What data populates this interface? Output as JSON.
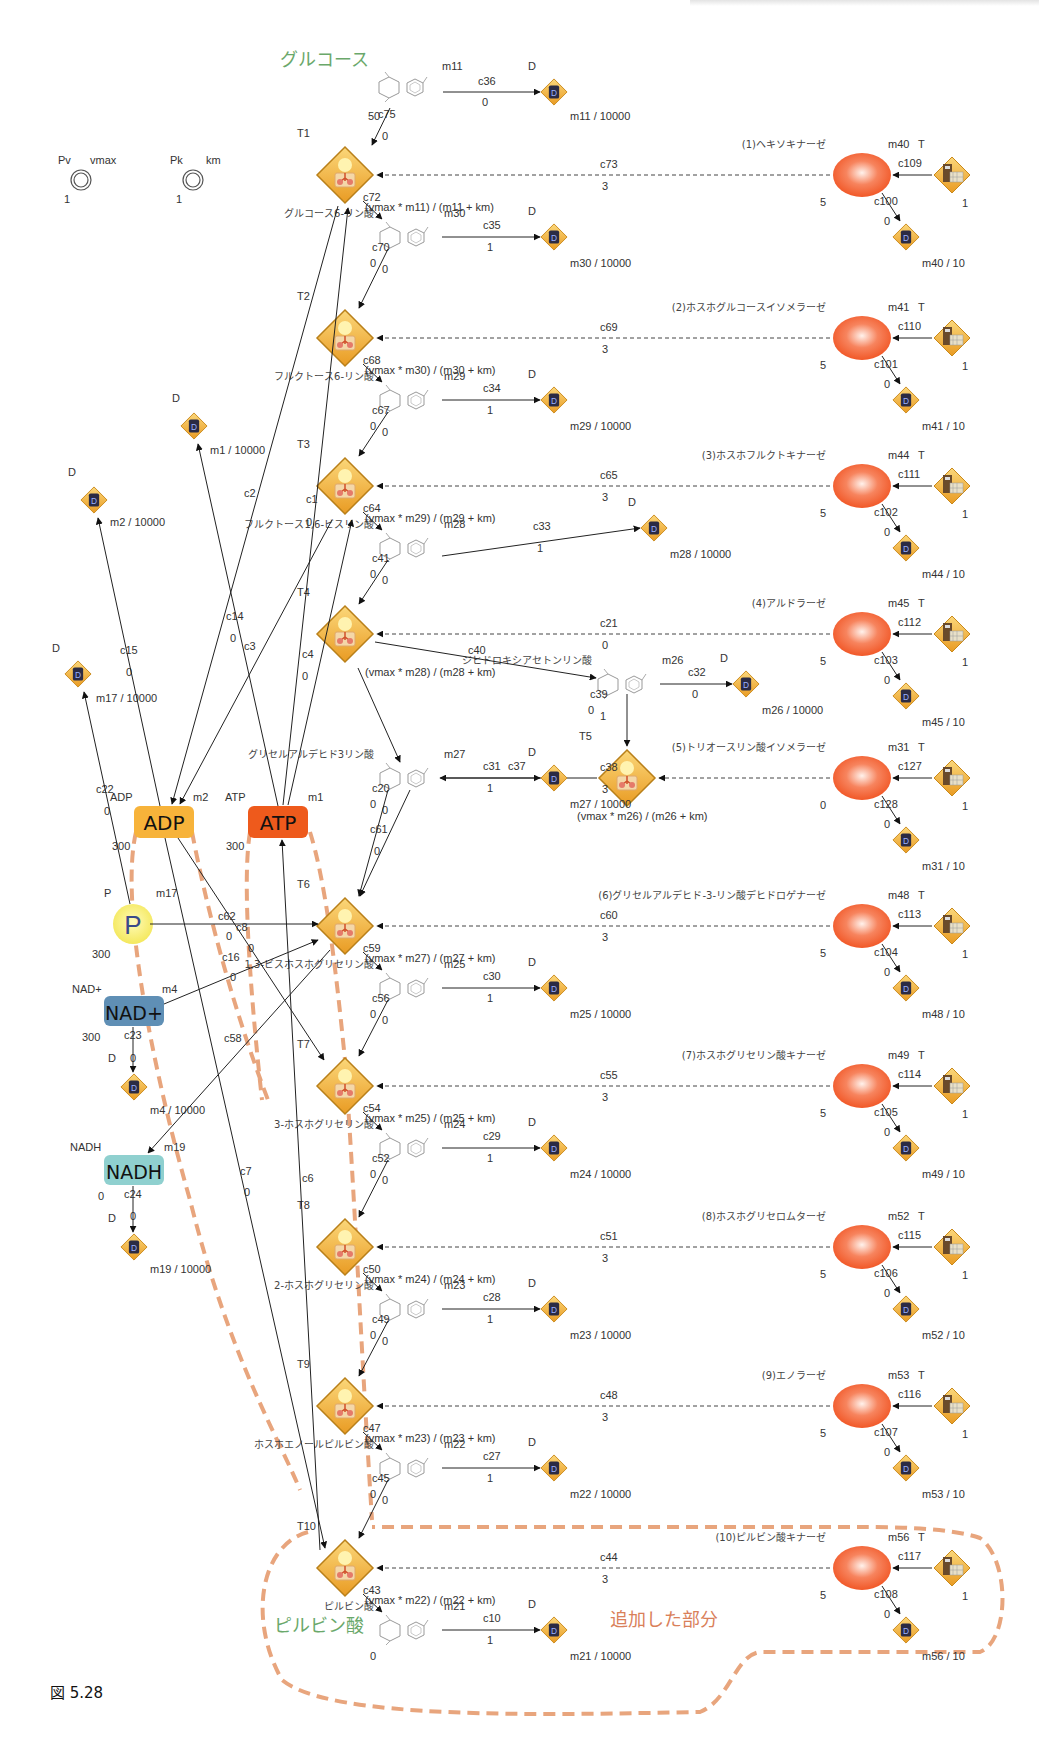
{
  "figure": {
    "caption": "図 5.28",
    "added_region_label": "追加した部分",
    "start_label": "グルコース",
    "end_label": "ピルビン酸",
    "colors": {
      "transition_fill": "#f3b33d",
      "enzyme_fill": "#f35b2b",
      "highlight": "#e8a57d",
      "green_label": "#6aa86a",
      "adp": "#f7b33a",
      "atp": "#ee5a1c",
      "p": "#f5ee7a",
      "nadp": "#5f8fb5",
      "nadh": "#8fd0cf"
    }
  },
  "parameters": [
    {
      "id": "Pv",
      "name": "vmax",
      "value": "1"
    },
    {
      "id": "Pk",
      "name": "km",
      "value": "1"
    }
  ],
  "glucose": {
    "id": "m11",
    "value": "50",
    "edge_in": "c75",
    "edge_in_weight": "0",
    "drain_edge": "c36",
    "drain_weight": "0",
    "drain_label": "D",
    "drain_expr": "m11 / 10000"
  },
  "steps": [
    {
      "transition": "T1",
      "rate": "(vmax * m11) / (m11 + km)",
      "out_edge": "c72",
      "product": "グルコース6-リン酸",
      "metabolite": "m30",
      "back_edge": "c70",
      "back_w1": "0",
      "back_w2": "0",
      "drain_edge": "c35",
      "drain_weight": "1",
      "drain_label": "D",
      "drain_expr": "m30 / 10000",
      "enzyme": {
        "name": "(1)ヘキソキナーゼ",
        "id": "m40",
        "type": "T",
        "edge": "c73",
        "edge_weight": "3",
        "initial": "5",
        "gen_edge": "c109",
        "gen_value": "1",
        "decay_edge": "c100",
        "decay_weight": "0",
        "decay_expr": "m40 / 10"
      }
    },
    {
      "transition": "T2",
      "rate": "(vmax * m30) / (m30 + km)",
      "out_edge": "c68",
      "product": "フルクトース6-リン酸",
      "metabolite": "m29",
      "back_edge": "c67",
      "back_w1": "0",
      "back_w2": "0",
      "drain_edge": "c34",
      "drain_weight": "1",
      "drain_label": "D",
      "drain_expr": "m29 / 10000",
      "enzyme": {
        "name": "(2)ホスホグルコースイソメラーゼ",
        "id": "m41",
        "type": "T",
        "edge": "c69",
        "edge_weight": "3",
        "initial": "5",
        "gen_edge": "c110",
        "gen_value": "1",
        "decay_edge": "c101",
        "decay_weight": "0",
        "decay_expr": "m41 / 10"
      }
    },
    {
      "transition": "T3",
      "rate": "(vmax * m29) / (m29 + km)",
      "out_edge": "c64",
      "product": "フルクトース1,6-ビスリン酸",
      "metabolite": "m28",
      "back_edge": "c41",
      "back_w1": "0",
      "back_w2": "0",
      "drain_edge": "c33",
      "drain_weight": "1",
      "drain_label": "D",
      "drain_expr": "m28 / 10000",
      "enzyme": {
        "name": "(3)ホスホフルクトキナーゼ",
        "id": "m44",
        "type": "T",
        "edge": "c65",
        "edge_weight": "3",
        "initial": "5",
        "gen_edge": "c111",
        "gen_value": "1",
        "decay_edge": "c102",
        "decay_weight": "0",
        "decay_expr": "m44 / 10"
      }
    },
    {
      "transition": "T4",
      "rate": "(vmax * m28) / (m28 + km)",
      "out_edge": "c40",
      "product": "ジヒドロキシアセトンリン酸",
      "metabolite": "m26",
      "back_edge": "c39",
      "back_w1": "0",
      "back_w2": "1",
      "drain_edge": "c32",
      "drain_weight": "0",
      "drain_label": "D",
      "drain_expr": "m26 / 10000",
      "enzyme": {
        "name": "(4)アルドラーゼ",
        "id": "m45",
        "type": "T",
        "edge": "c21",
        "edge_weight": "0",
        "initial": "5",
        "gen_edge": "c112",
        "gen_value": "1",
        "decay_edge": "c103",
        "decay_weight": "0",
        "decay_expr": "m45 / 10"
      }
    },
    {
      "transition": "T5",
      "rate": "(vmax * m26) / (m26 + km)",
      "out_edge": "c37",
      "product": "グリセルアルデヒド3リン酸",
      "metabolite": "m27",
      "back_edge": "c20",
      "back_w1": "0",
      "back_w2": "0",
      "drain_edge": "c31",
      "drain_weight": "1",
      "drain_label": "D",
      "drain_expr": "m27 / 10000",
      "enzyme": {
        "name": "(5)トリオースリン酸イソメラーゼ",
        "id": "m31",
        "type": "T",
        "edge": "c38",
        "edge_weight": "3",
        "initial": "0",
        "gen_edge": "c127",
        "gen_value": "1",
        "decay_edge": "c128",
        "decay_weight": "0",
        "decay_expr": "m31 / 10"
      }
    },
    {
      "transition": "T6",
      "rate": "(vmax * m27) / (m27 + km)",
      "out_edge": "c59",
      "product": "1,3-ビスホスホグリセリン酸",
      "metabolite": "m25",
      "back_edge": "c56",
      "back_w1": "0",
      "back_w2": "0",
      "drain_edge": "c30",
      "drain_weight": "1",
      "drain_label": "D",
      "drain_expr": "m25 / 10000",
      "enzyme": {
        "name": "(6)グリセルアルデヒド-3-リン酸デヒドロゲナーゼ",
        "id": "m48",
        "type": "T",
        "edge": "c60",
        "edge_weight": "3",
        "initial": "5",
        "gen_edge": "c113",
        "gen_value": "1",
        "decay_edge": "c104",
        "decay_weight": "0",
        "decay_expr": "m48 / 10"
      }
    },
    {
      "transition": "T7",
      "rate": "(vmax * m25) / (m25 + km)",
      "out_edge": "c54",
      "product": "3-ホスホグリセリン酸",
      "metabolite": "m24",
      "back_edge": "c52",
      "back_w1": "0",
      "back_w2": "0",
      "drain_edge": "c29",
      "drain_weight": "1",
      "drain_label": "D",
      "drain_expr": "m24 / 10000",
      "enzyme": {
        "name": "(7)ホスホグリセリン酸キナーゼ",
        "id": "m49",
        "type": "T",
        "edge": "c55",
        "edge_weight": "3",
        "initial": "5",
        "gen_edge": "c114",
        "gen_value": "1",
        "decay_edge": "c105",
        "decay_weight": "0",
        "decay_expr": "m49 / 10"
      }
    },
    {
      "transition": "T8",
      "rate": "(vmax * m24) / (m24 + km)",
      "out_edge": "c50",
      "product": "2-ホスホグリセリン酸",
      "metabolite": "m23",
      "back_edge": "c49",
      "back_w1": "0",
      "back_w2": "0",
      "drain_edge": "c28",
      "drain_weight": "1",
      "drain_label": "D",
      "drain_expr": "m23 / 10000",
      "enzyme": {
        "name": "(8)ホスホグリセロムターゼ",
        "id": "m52",
        "type": "T",
        "edge": "c51",
        "edge_weight": "3",
        "initial": "5",
        "gen_edge": "c115",
        "gen_value": "1",
        "decay_edge": "c106",
        "decay_weight": "0",
        "decay_expr": "m52 / 10"
      }
    },
    {
      "transition": "T9",
      "rate": "(vmax * m23) / (m23 + km)",
      "out_edge": "c47",
      "product": "ホスホエノールピルビン酸",
      "metabolite": "m22",
      "back_edge": "c45",
      "back_w1": "0",
      "back_w2": "0",
      "drain_edge": "c27",
      "drain_weight": "1",
      "drain_label": "D",
      "drain_expr": "m22 / 10000",
      "enzyme": {
        "name": "(9)エノラーゼ",
        "id": "m53",
        "type": "T",
        "edge": "c48",
        "edge_weight": "3",
        "initial": "5",
        "gen_edge": "c116",
        "gen_value": "1",
        "decay_edge": "c107",
        "decay_weight": "0",
        "decay_expr": "m53 / 10"
      }
    },
    {
      "transition": "T10",
      "rate": "(vmax * m22) / (m22 + km)",
      "out_edge": "c43",
      "product": "ピルビン酸",
      "metabolite": "m21",
      "back_edge": "",
      "back_w1": "0",
      "back_w2": "",
      "drain_edge": "c10",
      "drain_weight": "1",
      "drain_label": "D",
      "drain_expr": "m21 / 10000",
      "enzyme": {
        "name": "(10)ピルビン酸キナーゼ",
        "id": "m56",
        "type": "T",
        "edge": "c44",
        "edge_weight": "3",
        "initial": "5",
        "gen_edge": "c117",
        "gen_value": "1",
        "decay_edge": "c108",
        "decay_weight": "0",
        "decay_expr": "m56 / 10"
      }
    }
  ],
  "cofactors": {
    "adp": {
      "label": "ADP",
      "name": "ADP",
      "id": "m2",
      "value": "300",
      "drain_edge": "c15",
      "drain_weight": "0",
      "drain_label": "D",
      "drain_expr": "m2 / 10000"
    },
    "atp": {
      "label": "ATP",
      "name": "ATP",
      "id": "m1",
      "value": "300",
      "drain_label": "D",
      "drain_expr": "m1 / 10000"
    },
    "p": {
      "label": "P",
      "name": "P",
      "id": "m17",
      "value": "300",
      "drain_edge": "c22",
      "drain_weight": "0",
      "drain_label": "D",
      "drain_expr": "m17 / 10000"
    },
    "nadp": {
      "label": "NAD+",
      "name": "NAD+",
      "id": "m4",
      "value": "300",
      "drain_edge": "c23",
      "drain_weight": "0",
      "drain_label": "D",
      "drain_expr": "m4 / 10000"
    },
    "nadh": {
      "label": "NADH",
      "name": "NADH",
      "id": "m19",
      "value": "0",
      "drain_edge": "c24",
      "drain_weight": "0",
      "drain_label": "D",
      "drain_expr": "m19 / 10000"
    }
  },
  "cofactor_edges": [
    {
      "id": "c2",
      "weight": ""
    },
    {
      "id": "c1",
      "weight": "0"
    },
    {
      "id": "c14",
      "weight": "0"
    },
    {
      "id": "c3",
      "weight": ""
    },
    {
      "id": "c4",
      "weight": "0"
    },
    {
      "id": "c62",
      "weight": "0"
    },
    {
      "id": "c8",
      "weight": "0"
    },
    {
      "id": "c16",
      "weight": "0"
    },
    {
      "id": "c58",
      "weight": ""
    },
    {
      "id": "c7",
      "weight": "0"
    },
    {
      "id": "c6",
      "weight": ""
    },
    {
      "id": "c61",
      "weight": "0"
    }
  ]
}
